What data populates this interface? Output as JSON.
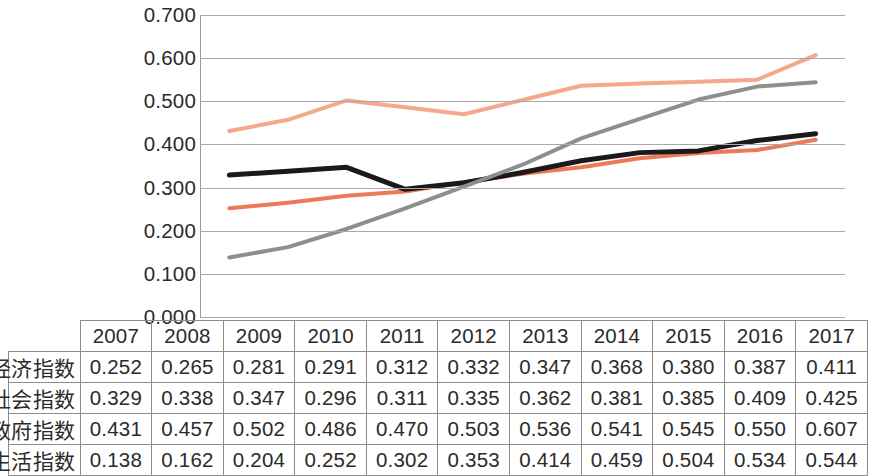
{
  "chart_data": {
    "type": "line",
    "title": "",
    "subtitle": "",
    "xlabel": "",
    "ylabel": "",
    "grid": true,
    "legend_position": "table-left",
    "categories": [
      "2007",
      "2008",
      "2009",
      "2010",
      "2011",
      "2012",
      "2013",
      "2014",
      "2015",
      "2016",
      "2017"
    ],
    "ylim": [
      0.0,
      0.7
    ],
    "ytick_labels": [
      "0.700",
      "0.600",
      "0.500",
      "0.400",
      "0.300",
      "0.200",
      "0.100",
      "0.000"
    ],
    "ytick_values": [
      0.7,
      0.6,
      0.5,
      0.4,
      0.3,
      0.2,
      0.1,
      0.0
    ],
    "series": [
      {
        "name": "信息经济指数",
        "color": "#ec7a58",
        "style": "solid",
        "width": 4,
        "values": [
          0.252,
          0.265,
          0.281,
          0.291,
          0.312,
          0.332,
          0.347,
          0.368,
          0.38,
          0.387,
          0.411
        ],
        "value_labels": [
          "0.252",
          "0.265",
          "0.281",
          "0.291",
          "0.312",
          "0.332",
          "0.347",
          "0.368",
          "0.380",
          "0.387",
          "0.411"
        ]
      },
      {
        "name": "网络社会指数",
        "color": "#1a1a1a",
        "style": "solid",
        "width": 5,
        "values": [
          0.329,
          0.338,
          0.347,
          0.296,
          0.311,
          0.335,
          0.362,
          0.381,
          0.385,
          0.409,
          0.425
        ],
        "value_labels": [
          "0.329",
          "0.338",
          "0.347",
          "0.296",
          "0.311",
          "0.335",
          "0.362",
          "0.381",
          "0.385",
          "0.409",
          "0.425"
        ]
      },
      {
        "name": "在线政府指数",
        "color": "#f5a98c",
        "style": "solid",
        "width": 4,
        "values": [
          0.431,
          0.457,
          0.502,
          0.486,
          0.47,
          0.503,
          0.536,
          0.541,
          0.545,
          0.55,
          0.607
        ],
        "value_labels": [
          "0.431",
          "0.457",
          "0.502",
          "0.486",
          "0.470",
          "0.503",
          "0.536",
          "0.541",
          "0.545",
          "0.550",
          "0.607"
        ]
      },
      {
        "name": "数字生活指数",
        "color": "#8e8e8e",
        "style": "solid",
        "width": 4,
        "values": [
          0.138,
          0.162,
          0.204,
          0.252,
          0.302,
          0.353,
          0.414,
          0.459,
          0.504,
          0.534,
          0.544
        ],
        "value_labels": [
          "0.138",
          "0.162",
          "0.204",
          "0.252",
          "0.302",
          "0.353",
          "0.414",
          "0.459",
          "0.504",
          "0.534",
          "0.544"
        ]
      }
    ]
  },
  "table": {
    "year_header": [
      "2007",
      "2008",
      "2009",
      "2010",
      "2011",
      "2012",
      "2013",
      "2014",
      "2015",
      "2016",
      "2017"
    ],
    "rows": [
      {
        "label": "信息经济指数",
        "swatch_color": "#ec7a58",
        "swatch_height": 5,
        "values": [
          "0.252",
          "0.265",
          "0.281",
          "0.291",
          "0.312",
          "0.332",
          "0.347",
          "0.368",
          "0.380",
          "0.387",
          "0.411"
        ]
      },
      {
        "label": "网络社会指数",
        "swatch_color": "#1a1a1a",
        "swatch_height": 6,
        "values": [
          "0.329",
          "0.338",
          "0.347",
          "0.296",
          "0.311",
          "0.335",
          "0.362",
          "0.381",
          "0.385",
          "0.409",
          "0.425"
        ]
      },
      {
        "label": "在线政府指数",
        "swatch_color": "#f5a98c",
        "swatch_height": 5,
        "values": [
          "0.431",
          "0.457",
          "0.502",
          "0.486",
          "0.470",
          "0.503",
          "0.536",
          "0.541",
          "0.545",
          "0.550",
          "0.607"
        ]
      },
      {
        "label": "数字生活指数",
        "swatch_color": "#8e8e8e",
        "swatch_height": 5,
        "values": [
          "0.138",
          "0.162",
          "0.204",
          "0.252",
          "0.302",
          "0.353",
          "0.414",
          "0.459",
          "0.504",
          "0.534",
          "0.544"
        ]
      }
    ]
  }
}
